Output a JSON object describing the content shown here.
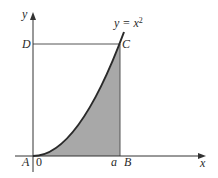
{
  "diagram": {
    "curve_label": {
      "lhs": "y = x",
      "exponent": "2"
    },
    "axis_labels": {
      "x": "x",
      "y": "y"
    },
    "point_labels": {
      "A": "A",
      "B": "B",
      "C": "C",
      "D": "D"
    },
    "tick_labels": {
      "origin": "0",
      "a": "a"
    },
    "colors": {
      "axis": "#333333",
      "curve": "#2a2a2a",
      "shade": "#a8a8a8",
      "line": "#555555",
      "background": "#ffffff"
    }
  }
}
